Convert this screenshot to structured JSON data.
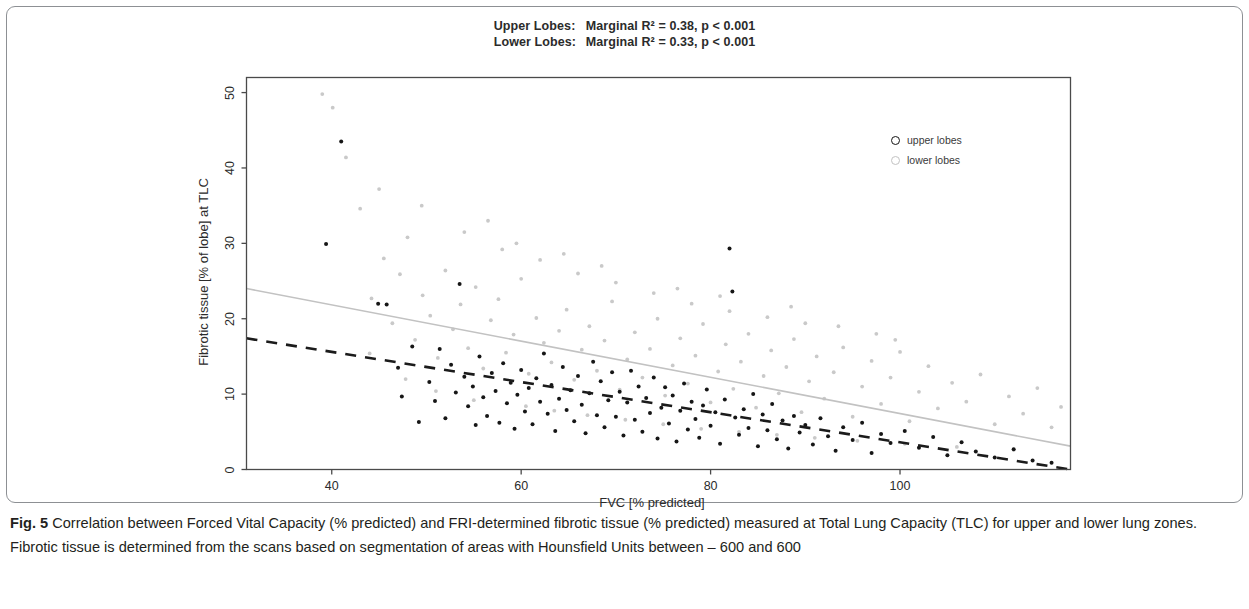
{
  "figure": {
    "label": "Fig. 5",
    "caption": "Correlation between Forced Vital Capacity (% predicted) and FRI-determined fibrotic tissue (% predicted) measured at Total Lung Capacity (TLC) for upper and lower lung zones. Fibrotic tissue is determined from the scans based on segmentation of areas with Hounsfield Units between – 600 and 600"
  },
  "chart_data": {
    "type": "scatter",
    "title": "",
    "annotations": [
      {
        "group": "Upper Lobes:",
        "text": "Marginal R² = 0.38, p < 0.001",
        "r_squared": 0.38,
        "p_value": "< 0.001"
      },
      {
        "group": "Lower Lobes:",
        "text": "Marginal R² = 0.33, p < 0.001",
        "r_squared": 0.33,
        "p_value": "< 0.001"
      }
    ],
    "xlabel": "FVC [% predicted]",
    "ylabel": "Fibrotic tissue [% of lobe] at TLC",
    "xlim": [
      31,
      118
    ],
    "ylim": [
      0,
      52
    ],
    "xticks": [
      40,
      60,
      80,
      100
    ],
    "yticks": [
      0,
      10,
      20,
      30,
      40,
      50
    ],
    "grid": false,
    "legend_position": "upper right",
    "colors": {
      "upper": "#141414",
      "lower": "#c2c2c2",
      "axis": "#2b2b2b"
    },
    "series": [
      {
        "name": "upper lobes",
        "marker": "filled-circle",
        "color": "#141414",
        "trendline": {
          "style": "dashed",
          "x": [
            31,
            118
          ],
          "y": [
            17.4,
            0.0
          ]
        },
        "points": [
          [
            39.4,
            29.9
          ],
          [
            41.0,
            43.5
          ],
          [
            44.9,
            22.0
          ],
          [
            45.8,
            21.9
          ],
          [
            47.0,
            13.5
          ],
          [
            47.4,
            9.7
          ],
          [
            48.5,
            16.3
          ],
          [
            49.2,
            6.3
          ],
          [
            50.3,
            11.6
          ],
          [
            50.9,
            9.1
          ],
          [
            51.4,
            16.0
          ],
          [
            52.0,
            6.8
          ],
          [
            52.6,
            13.9
          ],
          [
            53.1,
            10.2
          ],
          [
            53.5,
            24.6
          ],
          [
            54.0,
            12.3
          ],
          [
            54.4,
            8.4
          ],
          [
            54.9,
            11.0
          ],
          [
            55.2,
            5.9
          ],
          [
            55.6,
            15.0
          ],
          [
            56.0,
            9.6
          ],
          [
            56.4,
            7.1
          ],
          [
            56.9,
            12.8
          ],
          [
            57.3,
            10.4
          ],
          [
            57.7,
            6.2
          ],
          [
            58.1,
            14.1
          ],
          [
            58.5,
            8.8
          ],
          [
            58.9,
            11.5
          ],
          [
            59.3,
            5.4
          ],
          [
            59.6,
            9.9
          ],
          [
            60.0,
            13.2
          ],
          [
            60.4,
            7.7
          ],
          [
            60.8,
            10.8
          ],
          [
            61.2,
            6.0
          ],
          [
            61.6,
            12.1
          ],
          [
            62.0,
            9.0
          ],
          [
            62.4,
            15.4
          ],
          [
            62.8,
            7.4
          ],
          [
            63.2,
            11.2
          ],
          [
            63.6,
            5.1
          ],
          [
            64.0,
            9.4
          ],
          [
            64.4,
            13.6
          ],
          [
            64.8,
            7.9
          ],
          [
            65.2,
            10.5
          ],
          [
            65.6,
            6.4
          ],
          [
            66.0,
            12.4
          ],
          [
            66.4,
            8.6
          ],
          [
            66.8,
            4.8
          ],
          [
            67.2,
            10.1
          ],
          [
            67.6,
            14.3
          ],
          [
            68.0,
            7.2
          ],
          [
            68.4,
            11.7
          ],
          [
            68.8,
            5.6
          ],
          [
            69.2,
            9.2
          ],
          [
            69.6,
            12.9
          ],
          [
            70.0,
            7.0
          ],
          [
            70.4,
            10.3
          ],
          [
            70.8,
            4.5
          ],
          [
            71.2,
            8.9
          ],
          [
            71.6,
            13.1
          ],
          [
            72.0,
            6.6
          ],
          [
            72.4,
            11.0
          ],
          [
            72.8,
            5.0
          ],
          [
            73.2,
            9.5
          ],
          [
            73.6,
            7.5
          ],
          [
            74.0,
            12.2
          ],
          [
            74.4,
            4.1
          ],
          [
            74.8,
            8.2
          ],
          [
            75.2,
            10.9
          ],
          [
            75.6,
            6.1
          ],
          [
            76.0,
            9.8
          ],
          [
            76.4,
            3.7
          ],
          [
            76.8,
            7.8
          ],
          [
            77.2,
            11.4
          ],
          [
            77.6,
            5.3
          ],
          [
            78.0,
            9.0
          ],
          [
            78.4,
            6.7
          ],
          [
            78.8,
            4.2
          ],
          [
            79.2,
            8.5
          ],
          [
            79.6,
            10.6
          ],
          [
            80.0,
            5.8
          ],
          [
            80.5,
            7.6
          ],
          [
            81.0,
            3.4
          ],
          [
            81.5,
            9.3
          ],
          [
            82.0,
            29.3
          ],
          [
            82.3,
            23.6
          ],
          [
            82.6,
            6.9
          ],
          [
            83.0,
            4.6
          ],
          [
            83.5,
            8.0
          ],
          [
            84.0,
            5.5
          ],
          [
            84.5,
            10.0
          ],
          [
            85.0,
            3.1
          ],
          [
            85.5,
            7.3
          ],
          [
            86.0,
            5.2
          ],
          [
            86.5,
            8.7
          ],
          [
            87.0,
            4.0
          ],
          [
            87.6,
            6.5
          ],
          [
            88.2,
            2.8
          ],
          [
            88.8,
            7.1
          ],
          [
            89.4,
            4.9
          ],
          [
            90.0,
            5.9
          ],
          [
            90.8,
            3.3
          ],
          [
            91.6,
            6.8
          ],
          [
            92.4,
            4.4
          ],
          [
            93.2,
            2.5
          ],
          [
            94.0,
            5.6
          ],
          [
            95.0,
            3.9
          ],
          [
            96.0,
            6.2
          ],
          [
            97.0,
            2.2
          ],
          [
            98.0,
            4.7
          ],
          [
            99.0,
            3.5
          ],
          [
            100.5,
            5.1
          ],
          [
            102.0,
            2.9
          ],
          [
            103.5,
            4.3
          ],
          [
            105.0,
            1.9
          ],
          [
            106.5,
            3.6
          ],
          [
            108.0,
            2.4
          ],
          [
            110.0,
            1.6
          ],
          [
            112.0,
            2.7
          ],
          [
            114.0,
            1.2
          ],
          [
            116.0,
            0.9
          ]
        ]
      },
      {
        "name": "lower lobes",
        "marker": "light-circle",
        "color": "#c2c2c2",
        "trendline": {
          "style": "solid",
          "x": [
            31,
            118
          ],
          "y": [
            24.0,
            3.1
          ]
        },
        "points": [
          [
            39.0,
            49.8
          ],
          [
            40.1,
            48.0
          ],
          [
            41.5,
            41.4
          ],
          [
            43.0,
            34.6
          ],
          [
            44.2,
            22.7
          ],
          [
            45.5,
            28.0
          ],
          [
            46.4,
            19.4
          ],
          [
            47.2,
            25.9
          ],
          [
            48.0,
            30.8
          ],
          [
            48.8,
            17.2
          ],
          [
            49.6,
            23.1
          ],
          [
            50.4,
            20.4
          ],
          [
            51.2,
            14.8
          ],
          [
            52.0,
            26.4
          ],
          [
            52.8,
            18.6
          ],
          [
            53.6,
            21.9
          ],
          [
            54.4,
            16.1
          ],
          [
            55.2,
            24.2
          ],
          [
            56.0,
            13.4
          ],
          [
            56.8,
            19.8
          ],
          [
            57.6,
            22.6
          ],
          [
            58.4,
            15.5
          ],
          [
            59.2,
            17.9
          ],
          [
            60.0,
            25.3
          ],
          [
            60.8,
            12.7
          ],
          [
            61.6,
            20.1
          ],
          [
            62.4,
            16.8
          ],
          [
            63.2,
            14.2
          ],
          [
            64.0,
            18.4
          ],
          [
            64.8,
            21.2
          ],
          [
            65.6,
            11.9
          ],
          [
            66.4,
            15.9
          ],
          [
            67.2,
            19.0
          ],
          [
            68.0,
            13.1
          ],
          [
            68.8,
            17.1
          ],
          [
            69.6,
            22.3
          ],
          [
            70.4,
            10.6
          ],
          [
            71.2,
            14.6
          ],
          [
            72.0,
            18.2
          ],
          [
            72.8,
            12.2
          ],
          [
            73.6,
            16.0
          ],
          [
            74.4,
            20.0
          ],
          [
            75.2,
            9.8
          ],
          [
            76.0,
            13.8
          ],
          [
            76.8,
            17.4
          ],
          [
            77.6,
            11.4
          ],
          [
            78.4,
            15.1
          ],
          [
            79.2,
            19.3
          ],
          [
            80.0,
            8.9
          ],
          [
            80.8,
            13.0
          ],
          [
            81.6,
            16.6
          ],
          [
            82.4,
            10.7
          ],
          [
            83.2,
            14.3
          ],
          [
            84.0,
            18.0
          ],
          [
            84.8,
            8.2
          ],
          [
            85.6,
            12.4
          ],
          [
            86.4,
            15.8
          ],
          [
            87.2,
            10.1
          ],
          [
            88.0,
            13.6
          ],
          [
            88.8,
            17.3
          ],
          [
            89.6,
            7.6
          ],
          [
            90.4,
            11.7
          ],
          [
            91.2,
            15.0
          ],
          [
            92.0,
            9.4
          ],
          [
            93.0,
            12.9
          ],
          [
            94.0,
            16.2
          ],
          [
            95.0,
            7.0
          ],
          [
            96.0,
            11.0
          ],
          [
            97.0,
            14.4
          ],
          [
            98.0,
            8.7
          ],
          [
            99.0,
            12.2
          ],
          [
            100.0,
            15.6
          ],
          [
            101.0,
            6.4
          ],
          [
            102.0,
            10.3
          ],
          [
            103.0,
            13.7
          ],
          [
            104.0,
            8.1
          ],
          [
            105.5,
            11.5
          ],
          [
            107.0,
            9.0
          ],
          [
            108.5,
            12.6
          ],
          [
            110.0,
            6.0
          ],
          [
            111.5,
            9.7
          ],
          [
            113.0,
            7.4
          ],
          [
            114.5,
            10.8
          ],
          [
            116.0,
            5.6
          ],
          [
            117.0,
            8.3
          ],
          [
            56.5,
            33.0
          ],
          [
            58.0,
            29.2
          ],
          [
            62.0,
            27.8
          ],
          [
            66.0,
            26.0
          ],
          [
            70.0,
            24.8
          ],
          [
            74.0,
            23.4
          ],
          [
            78.0,
            22.0
          ],
          [
            82.0,
            21.0
          ],
          [
            86.0,
            20.2
          ],
          [
            90.0,
            19.4
          ],
          [
            45.0,
            37.2
          ],
          [
            49.5,
            35.0
          ],
          [
            54.0,
            31.5
          ],
          [
            59.5,
            30.0
          ],
          [
            64.5,
            28.6
          ],
          [
            68.5,
            27.0
          ],
          [
            76.5,
            24.0
          ],
          [
            81.0,
            23.0
          ],
          [
            88.5,
            21.6
          ],
          [
            93.5,
            19.0
          ],
          [
            97.5,
            18.0
          ],
          [
            99.5,
            17.2
          ],
          [
            44.0,
            15.4
          ],
          [
            47.8,
            12.0
          ],
          [
            51.0,
            10.4
          ],
          [
            55.0,
            9.2
          ],
          [
            60.5,
            8.4
          ],
          [
            63.5,
            7.8
          ],
          [
            67.0,
            7.2
          ],
          [
            71.0,
            6.6
          ],
          [
            75.0,
            6.0
          ],
          [
            79.0,
            5.4
          ],
          [
            83.0,
            5.0
          ],
          [
            87.0,
            4.6
          ],
          [
            91.0,
            4.2
          ],
          [
            95.5,
            3.8
          ],
          [
            100.5,
            3.4
          ],
          [
            106.0,
            3.0
          ],
          [
            112.0,
            2.6
          ]
        ]
      }
    ]
  },
  "legend": {
    "items": [
      {
        "label": "upper lobes",
        "marker": "upper"
      },
      {
        "label": "lower lobes",
        "marker": "lower"
      }
    ]
  }
}
